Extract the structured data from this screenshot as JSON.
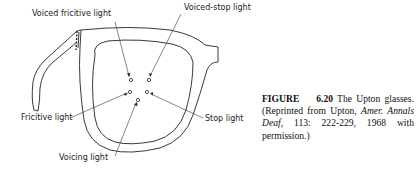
{
  "figure": {
    "labels": {
      "voiced_fricitive": "Voiced fricitive light",
      "voiced_stop": "Voiced-stop light",
      "fricitive": "Fricitive light",
      "stop": "Stop light",
      "voicing": "Voicing light"
    }
  },
  "caption": {
    "figure_label": "FIGURE",
    "figure_number": "6.20",
    "title": "The Upton glasses.",
    "source_prefix": "(Reprinted from Upton,",
    "journal": "Amer. Annals Deaf,",
    "citation": "113: 222-229, 1968 with permission.)"
  }
}
